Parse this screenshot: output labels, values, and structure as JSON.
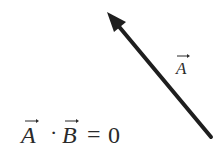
{
  "diagram": {
    "background": "#ffffff",
    "ink_color": "#1e1e1e",
    "vector": {
      "name": "A",
      "label": "A",
      "tail": [
        211,
        137
      ],
      "tip": [
        108,
        13
      ],
      "stroke_width": 4
    },
    "equation": {
      "left_operand": "A",
      "operator": "·",
      "right_operand": "B",
      "equals": "=",
      "result": "0"
    }
  }
}
